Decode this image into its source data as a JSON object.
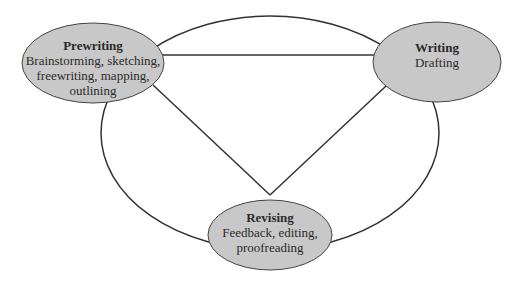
{
  "diagram": {
    "type": "writing-process-cycle",
    "nodes": [
      {
        "id": "prewriting",
        "title": "Prewriting",
        "description": "Brainstorming, sketching, freewriting, mapping, outlining",
        "lines": [
          "Brainstorming, sketching,",
          "freewriting, mapping,",
          "outlining"
        ]
      },
      {
        "id": "writing",
        "title": "Writing",
        "description": "Drafting",
        "lines": [
          "Drafting"
        ]
      },
      {
        "id": "revising",
        "title": "Revising",
        "description": "Feedback, editing, proofreading",
        "lines": [
          "Feedback, editing,",
          "proofreading"
        ]
      }
    ],
    "edges": [
      {
        "from": "prewriting",
        "to": "writing",
        "style": "straight"
      },
      {
        "from": "prewriting",
        "to": "revising",
        "style": "straight"
      },
      {
        "from": "writing",
        "to": "revising",
        "style": "straight"
      },
      {
        "from": "prewriting",
        "to": "writing",
        "style": "outer-arc"
      },
      {
        "from": "writing",
        "to": "revising",
        "style": "outer-arc"
      },
      {
        "from": "revising",
        "to": "prewriting",
        "style": "outer-arc"
      }
    ],
    "colors": {
      "node_fill": "#c8c8c8",
      "stroke": "#333333",
      "text": "#2a2a2a"
    }
  }
}
